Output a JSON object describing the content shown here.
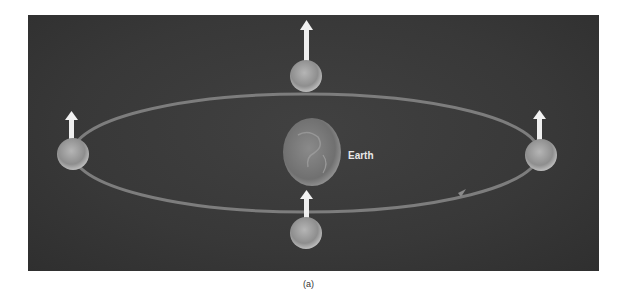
{
  "diagram": {
    "central_body": {
      "label": "Earth"
    },
    "caption": "(a)",
    "orbit": {
      "shape": "ellipse",
      "direction": "counter-clockwise",
      "arrow_position": "lower-right"
    },
    "satellites": [
      {
        "position": "top",
        "axis_arrow": "up"
      },
      {
        "position": "left",
        "axis_arrow": "up"
      },
      {
        "position": "right",
        "axis_arrow": "up"
      },
      {
        "position": "bottom",
        "axis_arrow": "up"
      }
    ],
    "colors": {
      "background": "#383838",
      "orbit": "#8a8a8a",
      "arrow": "#f2f2f2",
      "moon": "#a8a8a8"
    }
  }
}
